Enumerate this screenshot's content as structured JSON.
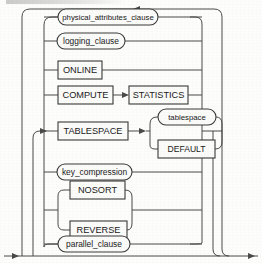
{
  "diagram": {
    "kind": "railroad-syntax-diagram",
    "background_color": "#fdfdfb",
    "line_color": "#4a4a4a",
    "text_color": "#1a1a1a",
    "box_fill": "#fbfbf9",
    "alternatives": [
      {
        "id": "physical-attributes-clause",
        "label": "physical_attributes_clause",
        "shape": "rounded",
        "kind": "nonterminal",
        "row": 1
      },
      {
        "id": "logging-clause",
        "label": "logging_clause",
        "shape": "rounded",
        "kind": "nonterminal",
        "row": 2
      },
      {
        "id": "online",
        "label": "ONLINE",
        "shape": "rect",
        "kind": "keyword",
        "row": 3
      },
      {
        "id": "compute-statistics",
        "label": "COMPUTE",
        "second_label": "STATISTICS",
        "shape": "rect",
        "kind": "keyword",
        "row": 4
      },
      {
        "id": "tablespace",
        "label": "TABLESPACE",
        "shape": "rect",
        "kind": "keyword",
        "row": 5,
        "choices": [
          {
            "id": "tablespace-name",
            "label": "tablespace",
            "shape": "rounded",
            "kind": "nonterminal"
          },
          {
            "id": "tablespace-default",
            "label": "DEFAULT",
            "shape": "rect",
            "kind": "keyword"
          }
        ]
      },
      {
        "id": "key-compression",
        "label": "key_compression",
        "shape": "rounded",
        "kind": "nonterminal",
        "row": 6
      },
      {
        "id": "nosort",
        "label": "NOSORT",
        "shape": "rect",
        "kind": "keyword",
        "row": 7
      },
      {
        "id": "reverse",
        "label": "REVERSE",
        "shape": "rect",
        "kind": "keyword",
        "row": 8
      },
      {
        "id": "parallel-clause",
        "label": "parallel_clause",
        "shape": "rounded",
        "kind": "nonterminal",
        "row": 9
      }
    ],
    "arrows": [
      {
        "id": "top-loopback-arrow",
        "direction": "left",
        "x": 137,
        "y": 6
      },
      {
        "id": "tablespace-entry-arrow",
        "direction": "right",
        "x": 44,
        "y": 131
      },
      {
        "id": "tablespace-split-arrow",
        "direction": "right",
        "x": 147,
        "y": 131
      },
      {
        "id": "compute-link-arrow",
        "direction": "right",
        "x": 130,
        "y": 95
      },
      {
        "id": "bottom-entry-arrow",
        "direction": "right",
        "x": 14,
        "y": 256
      },
      {
        "id": "bottom-exit-arrow",
        "direction": "right",
        "x": 250,
        "y": 256
      }
    ]
  }
}
